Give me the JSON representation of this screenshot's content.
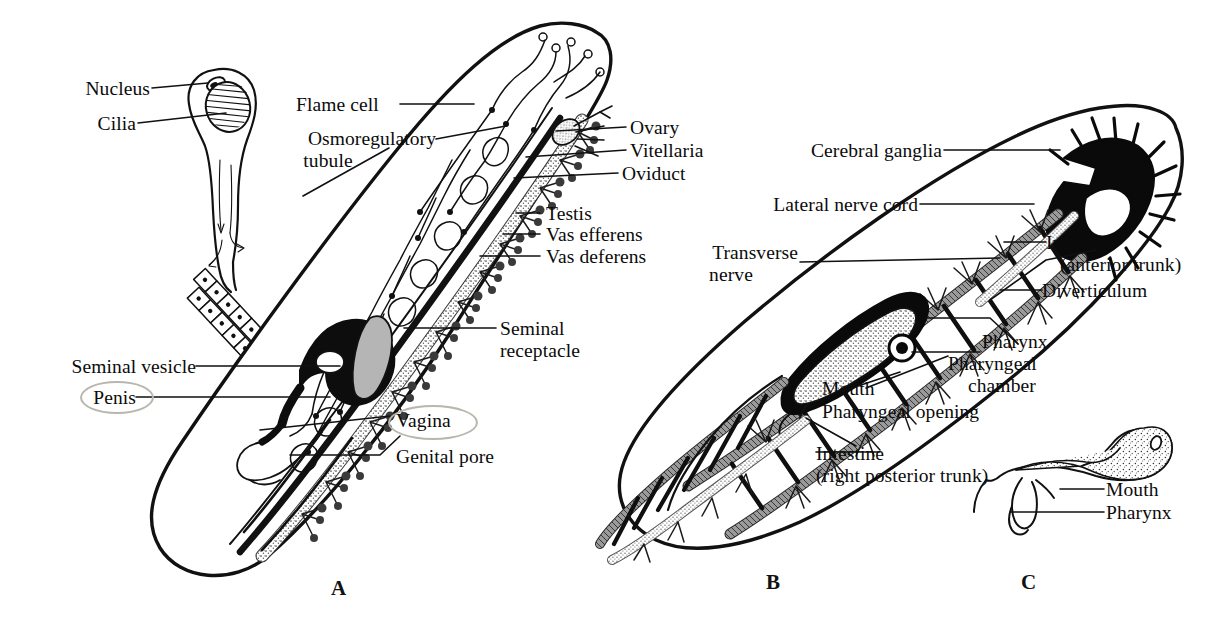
{
  "figure": {
    "background_color": "#ffffff",
    "ink_color": "#111111",
    "organ_fill_color": "#8a8a8a",
    "highlight_color": "#b9b7ad"
  },
  "panels": [
    {
      "id": "A",
      "label": "A",
      "caption": "Reproductive and osmoregulatory systems"
    },
    {
      "id": "B",
      "label": "B",
      "caption": "Nervous and digestive systems"
    },
    {
      "id": "C",
      "label": "C",
      "caption": "Pharynx detail"
    }
  ],
  "panel_a": {
    "labels": [
      {
        "name": "nucleus",
        "text": "Nucleus"
      },
      {
        "name": "cilia",
        "text": "Cilia"
      },
      {
        "name": "flame-cell",
        "text": "Flame cell"
      },
      {
        "name": "osmoregulatory-tubule",
        "text": "Osmoregulatory",
        "text2": "tubule"
      },
      {
        "name": "ovary",
        "text": "Ovary"
      },
      {
        "name": "vitellaria",
        "text": "Vitellaria"
      },
      {
        "name": "oviduct",
        "text": "Oviduct"
      },
      {
        "name": "testis",
        "text": "Testis"
      },
      {
        "name": "vas-efferens",
        "text": "Vas efferens"
      },
      {
        "name": "vas-deferens",
        "text": "Vas deferens"
      },
      {
        "name": "seminal-receptacle",
        "text": "Seminal",
        "text2": "receptacle"
      },
      {
        "name": "seminal-vesicle",
        "text": "Seminal vesicle"
      },
      {
        "name": "penis",
        "text": "Penis",
        "highlighted": true
      },
      {
        "name": "vagina",
        "text": "Vagina",
        "highlighted": true
      },
      {
        "name": "genital-pore",
        "text": "Genital pore"
      }
    ]
  },
  "panel_b": {
    "labels": [
      {
        "name": "cerebral-ganglia",
        "text": "Cerebral ganglia"
      },
      {
        "name": "lateral-nerve-cord",
        "text": "Lateral nerve cord"
      },
      {
        "name": "transverse-nerve",
        "text": "Transverse",
        "text2": "nerve"
      },
      {
        "name": "intestine-anterior-trunk",
        "text": "Intestine",
        "text2": "(anterior trunk)"
      },
      {
        "name": "diverticulum",
        "text": "Diverticulum"
      },
      {
        "name": "pharynx",
        "text": "Pharynx"
      },
      {
        "name": "pharyngeal-chamber",
        "text": "Pharyngeal",
        "text2": "chamber"
      },
      {
        "name": "mouth",
        "text": "Mouth"
      },
      {
        "name": "pharyngeal-opening",
        "text": "Pharyngeal opening"
      },
      {
        "name": "intestine-right-posterior-trunk",
        "text": "Intestine",
        "text2": "(right posterior trunk)"
      }
    ]
  },
  "panel_c": {
    "labels": [
      {
        "name": "mouth",
        "text": "Mouth"
      },
      {
        "name": "pharynx",
        "text": "Pharynx"
      }
    ]
  }
}
